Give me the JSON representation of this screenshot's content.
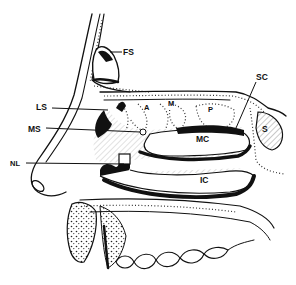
{
  "figure": {
    "labels": {
      "fs": "FS",
      "sc": "SC",
      "ls": "LS",
      "a": "A",
      "m": "M",
      "p": "P",
      "ms": "MS",
      "mc": "MC",
      "s": "S",
      "nl": "NL",
      "ic": "IC"
    }
  }
}
